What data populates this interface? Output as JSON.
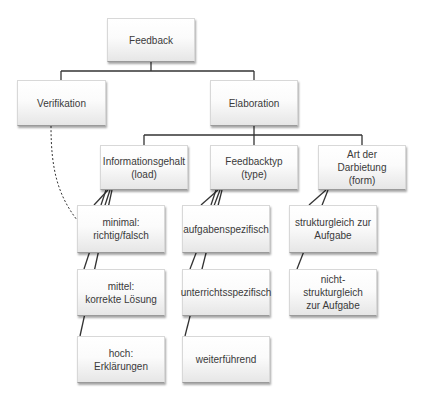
{
  "diagram": {
    "title": "Feedback",
    "line_color": "#333333",
    "nodes": [
      {
        "id": "feedback",
        "label": "Feedback",
        "x": 107,
        "y": 18,
        "w": 88,
        "h": 44
      },
      {
        "id": "verifikation",
        "label": "Verifikation",
        "x": 17,
        "y": 80,
        "w": 89,
        "h": 46
      },
      {
        "id": "elaboration",
        "label": "Elaboration",
        "x": 210,
        "y": 80,
        "w": 88,
        "h": 46
      },
      {
        "id": "informationsgehalt",
        "label": "Informationsgehalt\n(load)",
        "x": 100,
        "y": 145,
        "w": 88,
        "h": 45
      },
      {
        "id": "feedbacktyp",
        "label": "Feedbacktyp   (type)",
        "x": 210,
        "y": 145,
        "w": 88,
        "h": 45
      },
      {
        "id": "art-der-darbietung",
        "label": "Art der Darbietung\n(form)",
        "x": 318,
        "y": 145,
        "w": 88,
        "h": 45
      },
      {
        "id": "minimal",
        "label": "minimal:\nrichtig/falsch",
        "x": 77,
        "y": 205,
        "w": 88,
        "h": 48
      },
      {
        "id": "mittel",
        "label": "mittel:\nkorrekte Lösung",
        "x": 77,
        "y": 269,
        "w": 88,
        "h": 47
      },
      {
        "id": "hoch",
        "label": "hoch:\nErklärungen",
        "x": 77,
        "y": 336,
        "w": 88,
        "h": 47
      },
      {
        "id": "aufgabenspezifisch",
        "label": "aufgabenspezifisch",
        "x": 182,
        "y": 205,
        "w": 88,
        "h": 48
      },
      {
        "id": "unterrichtsspezifisch",
        "label": "unterrichtsspezifisch",
        "x": 182,
        "y": 269,
        "w": 88,
        "h": 47
      },
      {
        "id": "weiterfuehrend",
        "label": "weiterführend",
        "x": 182,
        "y": 336,
        "w": 88,
        "h": 47
      },
      {
        "id": "strukturgleich",
        "label": "strukturgleich zur\nAufgabe",
        "x": 289,
        "y": 205,
        "w": 88,
        "h": 48
      },
      {
        "id": "nicht-strukturgleich",
        "label": "nicht-strukturgleich\nzur Aufgabe",
        "x": 289,
        "y": 269,
        "w": 88,
        "h": 47
      }
    ],
    "edges": [
      {
        "from": "Feedback",
        "to": "Verifikation",
        "style": "solid"
      },
      {
        "from": "Feedback",
        "to": "Elaboration",
        "style": "solid"
      },
      {
        "from": "Elaboration",
        "to": "Informationsgehalt (load)",
        "style": "solid"
      },
      {
        "from": "Elaboration",
        "to": "Feedbacktyp (type)",
        "style": "solid"
      },
      {
        "from": "Elaboration",
        "to": "Art der Darbietung (form)",
        "style": "solid"
      },
      {
        "from": "Informationsgehalt (load)",
        "to": "minimal: richtig/falsch",
        "style": "solid"
      },
      {
        "from": "Informationsgehalt (load)",
        "to": "mittel: korrekte Lösung",
        "style": "solid"
      },
      {
        "from": "Informationsgehalt (load)",
        "to": "hoch: Erklärungen",
        "style": "solid"
      },
      {
        "from": "Feedbacktyp (type)",
        "to": "aufgabenspezifisch",
        "style": "solid"
      },
      {
        "from": "Feedbacktyp (type)",
        "to": "unterrichtsspezifisch",
        "style": "solid"
      },
      {
        "from": "Feedbacktyp (type)",
        "to": "weiterführend",
        "style": "solid"
      },
      {
        "from": "Art der Darbietung (form)",
        "to": "strukturgleich zur Aufgabe",
        "style": "solid"
      },
      {
        "from": "Art der Darbietung (form)",
        "to": "nicht-strukturgleich zur Aufgabe",
        "style": "solid"
      },
      {
        "from": "Verifikation",
        "to": "minimal: richtig/falsch",
        "style": "dashed"
      }
    ]
  }
}
